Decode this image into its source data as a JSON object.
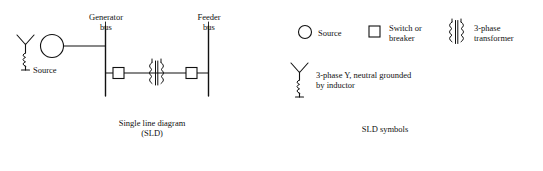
{
  "figure": {
    "left_panel": {
      "labels": {
        "source": "Source",
        "generator_bus_line1": "Generator",
        "generator_bus_line2": "bus",
        "feeder_bus_line1": "Feeder",
        "feeder_bus_line2": "bus",
        "caption_line1": "Single line diagram",
        "caption_line2": "(SLD)"
      },
      "components": [
        "source-y-neutral-grounded-inductor",
        "generator-circle",
        "generator-bus-vertical",
        "switch-breaker-square-left",
        "three-phase-transformer",
        "switch-breaker-square-right",
        "feeder-bus-vertical"
      ]
    },
    "right_panel": {
      "caption": "SLD symbols",
      "legend": [
        {
          "symbol": "circle",
          "label": "Source"
        },
        {
          "symbol": "square",
          "label": "Switch or\nbreaker"
        },
        {
          "symbol": "transformer",
          "label_line1": "3-phase",
          "label_line2": "transformer"
        },
        {
          "symbol": "y-neutral-inductor",
          "label_line1": "3-phase Y, neutral grounded",
          "label_line2": "by inductor"
        }
      ],
      "legend_labels": {
        "source": "Source",
        "switch_line1": "Switch or",
        "switch_line2": "breaker",
        "transformer_line1": "3-phase",
        "transformer_line2": "transformer",
        "wye_line1": "3-phase Y, neutral grounded",
        "wye_line2": "by inductor"
      }
    },
    "colors": {
      "stroke": "#111111",
      "background": "#ffffff"
    }
  }
}
